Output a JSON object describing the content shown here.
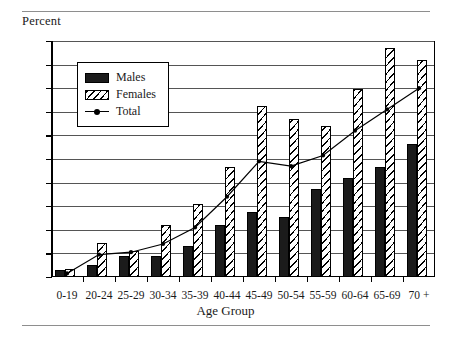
{
  "figure": {
    "ylabel": "Percent",
    "xlabel": "Age Group"
  },
  "legend": {
    "items": [
      {
        "label": "Males",
        "marker": "solid-black-swatch"
      },
      {
        "label": "Females",
        "marker": "hatched-swatch"
      },
      {
        "label": "Total",
        "marker": "line-with-dot-marker"
      }
    ]
  },
  "axis": {
    "y_ticks": [
      "0",
      "2",
      "4",
      "6",
      "8",
      "10",
      "12",
      "14",
      "16",
      "18",
      "20"
    ],
    "x_ticks": [
      "0-19",
      "20-24",
      "25-29",
      "30-34",
      "35-39",
      "40-44",
      "45-49",
      "50-54",
      "55-59",
      "60-64",
      "65-69",
      "70 +"
    ]
  },
  "chart_data": {
    "type": "bar",
    "title": "",
    "subtitle": "",
    "xlabel": "Age Group",
    "ylabel": "Percent",
    "ylim": [
      0,
      20
    ],
    "ytick_step": 2,
    "grid": true,
    "legend_position": "upper-left-inside",
    "categories": [
      "0-19",
      "20-24",
      "25-29",
      "30-34",
      "35-39",
      "40-44",
      "45-49",
      "50-54",
      "55-59",
      "60-64",
      "65-69",
      "70 +"
    ],
    "series": [
      {
        "name": "Males",
        "type": "bar",
        "color": "#1b1b1b",
        "fill": "solid",
        "values": [
          0.6,
          1.0,
          1.8,
          1.8,
          2.6,
          4.4,
          5.5,
          5.1,
          7.5,
          8.4,
          9.3,
          11.3
        ]
      },
      {
        "name": "Females",
        "type": "bar",
        "color": "#ffffff",
        "fill": "diagonal-hatch",
        "values": [
          0.7,
          2.9,
          2.2,
          4.4,
          6.2,
          9.3,
          14.5,
          13.4,
          12.8,
          15.9,
          19.4,
          18.4
        ]
      },
      {
        "name": "Total",
        "type": "line",
        "color": "#000000",
        "marker": "dot",
        "values": [
          0.3,
          1.9,
          2.1,
          2.8,
          4.2,
          6.8,
          9.8,
          9.4,
          10.3,
          12.4,
          14.2,
          16.0
        ]
      }
    ]
  }
}
